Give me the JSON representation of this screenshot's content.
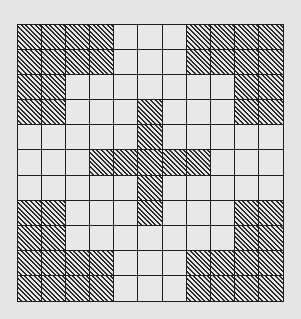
{
  "grid": {
    "rows": 11,
    "cols": 11,
    "line_color": "#1e1e1e",
    "background_color": "#e4e4e4",
    "hatch_style": "diagonal-lines",
    "shaded_cells": [
      [
        1,
        1,
        1,
        1,
        0,
        0,
        0,
        1,
        1,
        1,
        1
      ],
      [
        1,
        1,
        1,
        1,
        0,
        0,
        0,
        1,
        1,
        1,
        1
      ],
      [
        1,
        1,
        0,
        0,
        0,
        0,
        0,
        0,
        0,
        1,
        1
      ],
      [
        1,
        1,
        0,
        0,
        0,
        1,
        0,
        0,
        0,
        1,
        1
      ],
      [
        0,
        0,
        0,
        0,
        0,
        1,
        0,
        0,
        0,
        0,
        0
      ],
      [
        0,
        0,
        0,
        1,
        1,
        1,
        1,
        1,
        0,
        0,
        0
      ],
      [
        0,
        0,
        0,
        0,
        0,
        1,
        0,
        0,
        0,
        0,
        0
      ],
      [
        1,
        1,
        0,
        0,
        0,
        1,
        0,
        0,
        0,
        1,
        1
      ],
      [
        1,
        1,
        0,
        0,
        0,
        0,
        0,
        0,
        0,
        1,
        1
      ],
      [
        1,
        1,
        1,
        1,
        0,
        0,
        0,
        1,
        1,
        1,
        1
      ],
      [
        1,
        1,
        1,
        1,
        0,
        0,
        0,
        1,
        1,
        1,
        1
      ]
    ]
  }
}
